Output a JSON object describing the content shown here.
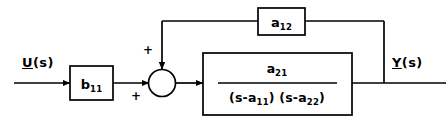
{
  "diagram": {
    "type": "control-system-block-diagram",
    "stroke_color": "#000000",
    "background_color": "#ffffff",
    "signals": {
      "input": {
        "vector": "U",
        "argument": "(s)",
        "full": "U(s)"
      },
      "output": {
        "vector": "Y",
        "argument": "(s)",
        "full": "Y(s)"
      }
    },
    "blocks": [
      {
        "id": "input-gain-block",
        "label_base": "b",
        "label_sub": "11",
        "full": "b11"
      },
      {
        "id": "feedback-gain-block",
        "label_base": "a",
        "label_sub": "12",
        "full": "a12"
      },
      {
        "id": "plant-transfer-function-block",
        "numerator_base": "a",
        "numerator_sub": "21",
        "denominator_factor1_prefix": "(s-a",
        "denominator_factor1_sub": "11",
        "denominator_factor1_suffix": ")",
        "denominator_factor2_prefix": "(s-a",
        "denominator_factor2_sub": "22",
        "denominator_factor2_suffix": ")",
        "full": "a21 / (s-a11)(s-a22)"
      }
    ],
    "summing_junction": {
      "id": "summing-junction",
      "sign_top": "+",
      "sign_bottom": "+"
    }
  }
}
